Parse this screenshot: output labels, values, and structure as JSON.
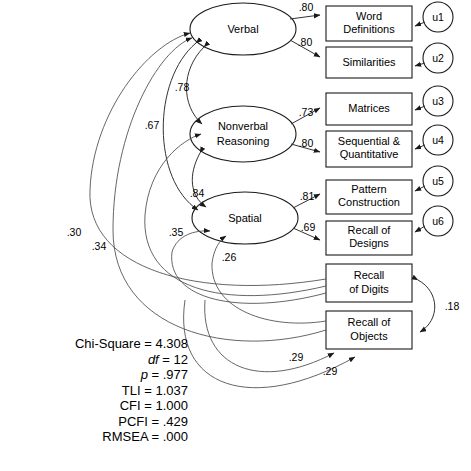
{
  "figure": {
    "type": "sem-path-diagram"
  },
  "latent_factors": [
    {
      "id": "verbal",
      "label": "Verbal",
      "label_lines": [
        "Verbal"
      ]
    },
    {
      "id": "nonverbal",
      "label": "Nonverbal Reasoning",
      "label_lines": [
        "Nonverbal",
        "Reasoning"
      ]
    },
    {
      "id": "spatial",
      "label": "Spatial",
      "label_lines": [
        "Spatial"
      ]
    }
  ],
  "observed_variables": [
    {
      "id": "word_definitions",
      "label": "Word Definitions",
      "label_lines": [
        "Word",
        "Definitions"
      ]
    },
    {
      "id": "similarities",
      "label": "Similarities",
      "label_lines": [
        "Similarities"
      ]
    },
    {
      "id": "matrices",
      "label": "Matrices",
      "label_lines": [
        "Matrices"
      ]
    },
    {
      "id": "seq_quant",
      "label": "Sequential & Quantitative",
      "label_lines": [
        "Sequential &",
        "Quantitative"
      ]
    },
    {
      "id": "pattern_construction",
      "label": "Pattern Construction",
      "label_lines": [
        "Pattern",
        "Construction"
      ]
    },
    {
      "id": "recall_designs",
      "label": "Recall of Designs",
      "label_lines": [
        "Recall of",
        "Designs"
      ]
    },
    {
      "id": "recall_digits",
      "label": "Recall of Digits",
      "label_lines": [
        "Recall",
        "of Digits"
      ]
    },
    {
      "id": "recall_objects",
      "label": "Recall of Objects",
      "label_lines": [
        "Recall of",
        "Objects"
      ]
    }
  ],
  "error_terms": [
    {
      "id": "u1",
      "label": "u1"
    },
    {
      "id": "u2",
      "label": "u2"
    },
    {
      "id": "u3",
      "label": "u3"
    },
    {
      "id": "u4",
      "label": "u4"
    },
    {
      "id": "u5",
      "label": "u5"
    },
    {
      "id": "u6",
      "label": "u6"
    }
  ],
  "factor_loadings": [
    {
      "from": "verbal",
      "to": "word_definitions",
      "value": ".80"
    },
    {
      "from": "verbal",
      "to": "similarities",
      "value": ".80"
    },
    {
      "from": "nonverbal",
      "to": "matrices",
      "value": ".73"
    },
    {
      "from": "nonverbal",
      "to": "seq_quant",
      "value": ".80"
    },
    {
      "from": "spatial",
      "to": "pattern_construction",
      "value": ".81"
    },
    {
      "from": "spatial",
      "to": "recall_designs",
      "value": ".69"
    }
  ],
  "factor_correlations": [
    {
      "between": [
        "verbal",
        "nonverbal"
      ],
      "value": ".78"
    },
    {
      "between": [
        "verbal",
        "spatial"
      ],
      "value": ".67"
    },
    {
      "between": [
        "nonverbal",
        "spatial"
      ],
      "value": ".84"
    }
  ],
  "cross_paths": [
    {
      "from": "recall_digits",
      "to": "verbal",
      "value": ".30"
    },
    {
      "from": "recall_objects",
      "to": "verbal",
      "value": ".34"
    },
    {
      "from": "recall_digits",
      "to": "nonverbal",
      "value": ".35"
    },
    {
      "from": "recall_objects",
      "to": "spatial",
      "value": ".26"
    },
    {
      "from": "recall_objects",
      "to": "recall_digits",
      "value": ".29"
    },
    {
      "from": "recall_objects",
      "to": "recall_digits_b",
      "value": ".29"
    }
  ],
  "residual_correlations": [
    {
      "between": [
        "recall_digits",
        "recall_objects"
      ],
      "value": ".18"
    }
  ],
  "coefficient_labels": {
    "l_word_definitions": ".80",
    "l_similarities": ".80",
    "l_matrices": ".73",
    "l_seq_quant": ".80",
    "l_pattern_construction": ".81",
    "l_recall_designs": ".69",
    "c_verbal_nonverbal": ".78",
    "c_verbal_spatial": ".67",
    "c_nonverbal_spatial": ".84",
    "c_30": ".30",
    "c_34": ".34",
    "c_35": ".35",
    "c_26": ".26",
    "c_29_a": ".29",
    "c_29_b": ".29",
    "c_18": ".18"
  },
  "fit_statistics": {
    "chi_square_label": "Chi-Square = 4.308",
    "df_prefix": "df",
    "df_value": " = 12",
    "p_prefix": "p",
    "p_value": " = .977",
    "tli": "TLI = 1.037",
    "cfi": "CFI = 1.000",
    "pcfi": "PCFI = .429",
    "rmsea": "RMSEA = .000"
  },
  "colors": {
    "stroke": "#1a1a1a",
    "path": "#333333",
    "background": "#ffffff",
    "text": "#000000"
  }
}
